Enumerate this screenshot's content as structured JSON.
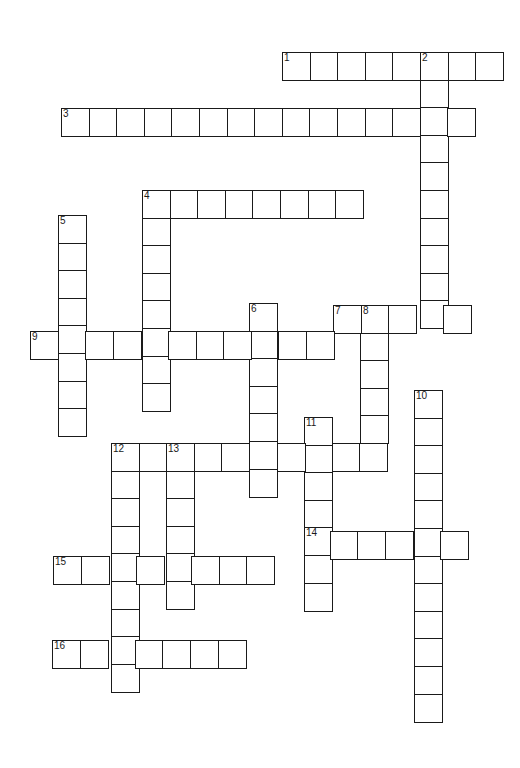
{
  "puzzle": {
    "cell_size": 27.6,
    "border_color": "#1a1a1a",
    "background": "#ffffff",
    "words": [
      {
        "number": "1",
        "direction": "across",
        "x": 282,
        "y": 52,
        "length": 8
      },
      {
        "number": "2",
        "direction": "down",
        "x": 420,
        "y": 52,
        "length": 10
      },
      {
        "number": "3",
        "direction": "across",
        "x": 61,
        "y": 108,
        "length": 15
      },
      {
        "number": "4",
        "direction": "across",
        "x": 142,
        "y": 190,
        "length": 8
      },
      {
        "number": "4",
        "direction": "down",
        "x": 142,
        "y": 190,
        "length": 8
      },
      {
        "number": "5",
        "direction": "down",
        "x": 58,
        "y": 215,
        "length": 8
      },
      {
        "number": "6",
        "direction": "down",
        "x": 249,
        "y": 303,
        "length": 7
      },
      {
        "number": "7",
        "direction": "across",
        "x": 333,
        "y": 305,
        "length": 5
      },
      {
        "number": "8",
        "direction": "down",
        "x": 360,
        "y": 305,
        "length": 5
      },
      {
        "number": "9",
        "direction": "across",
        "x": 30,
        "y": 331,
        "length": 11
      },
      {
        "number": "10",
        "direction": "down",
        "x": 414,
        "y": 390,
        "length": 12
      },
      {
        "number": "11",
        "direction": "down",
        "x": 304,
        "y": 417,
        "length": 7
      },
      {
        "number": "12",
        "direction": "across",
        "x": 111,
        "y": 443,
        "length": 10
      },
      {
        "number": "12",
        "direction": "down",
        "x": 111,
        "y": 443,
        "length": 9
      },
      {
        "number": "13",
        "direction": "down",
        "x": 166,
        "y": 443,
        "length": 6
      },
      {
        "number": "14",
        "direction": "across",
        "x": 302,
        "y": 531,
        "length": 6
      },
      {
        "number": "15",
        "direction": "across",
        "x": 53,
        "y": 556,
        "length": 8
      },
      {
        "number": "16",
        "direction": "across",
        "x": 52,
        "y": 640,
        "length": 7
      }
    ]
  }
}
